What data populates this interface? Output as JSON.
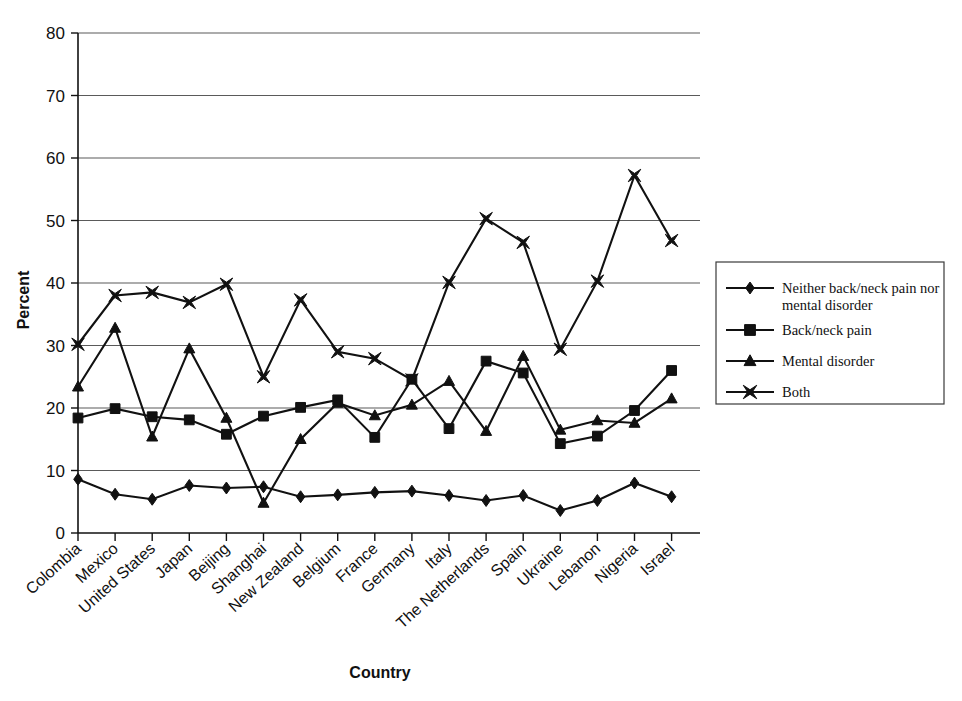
{
  "chart_data": {
    "type": "line",
    "title": "",
    "xlabel": "Country",
    "ylabel": "Percent",
    "ylim": [
      0,
      80
    ],
    "ytick_step": 10,
    "yticks": [
      "0",
      "10",
      "20",
      "30",
      "40",
      "50",
      "60",
      "70",
      "80"
    ],
    "grid": true,
    "legend_position": "right",
    "categories": [
      "Colombia",
      "Mexico",
      "United States",
      "Japan",
      "Beijing",
      "Shanghai",
      "New Zealand",
      "Belgium",
      "France",
      "Germany",
      "Italy",
      "The Netherlands",
      "Spain",
      "Ukraine",
      "Lebanon",
      "Nigeria",
      "Israel"
    ],
    "series": [
      {
        "name": "Neither back/neck pain nor mental disorder",
        "marker": "diamond",
        "values": [
          8.6,
          6.2,
          5.4,
          7.6,
          7.2,
          7.4,
          5.8,
          6.1,
          6.5,
          6.7,
          6.0,
          5.2,
          6.0,
          3.6,
          5.2,
          8.0,
          5.8
        ]
      },
      {
        "name": "Back/neck pain",
        "marker": "square",
        "values": [
          18.4,
          19.9,
          18.6,
          18.1,
          15.8,
          18.7,
          20.1,
          21.3,
          15.3,
          24.6,
          16.7,
          27.5,
          25.6,
          14.3,
          15.5,
          19.6,
          26.0
        ]
      },
      {
        "name": "Mental disorder",
        "marker": "triangle",
        "values": [
          23.4,
          32.8,
          15.4,
          29.5,
          18.4,
          4.8,
          15.0,
          20.8,
          18.8,
          20.5,
          24.3,
          16.3,
          28.3,
          16.5,
          18.0,
          17.6,
          21.5
        ]
      },
      {
        "name": "Both",
        "marker": "bowtie",
        "values": [
          30.2,
          38.0,
          38.5,
          36.9,
          39.8,
          25.0,
          37.3,
          29.0,
          27.9,
          24.5,
          40.1,
          50.3,
          46.5,
          29.4,
          40.3,
          57.2,
          46.8
        ]
      }
    ],
    "legend_entries": [
      {
        "label": "Neither back/neck pain nor mental disorder",
        "marker": "diamond"
      },
      {
        "label": "Back/neck pain",
        "marker": "square"
      },
      {
        "label": "Mental disorder",
        "marker": "triangle"
      },
      {
        "label": "Both",
        "marker": "bowtie"
      }
    ],
    "colors": {
      "series": "#111111",
      "grid": "#5a5a5a",
      "axis": "#111111",
      "background": "#ffffff"
    }
  }
}
